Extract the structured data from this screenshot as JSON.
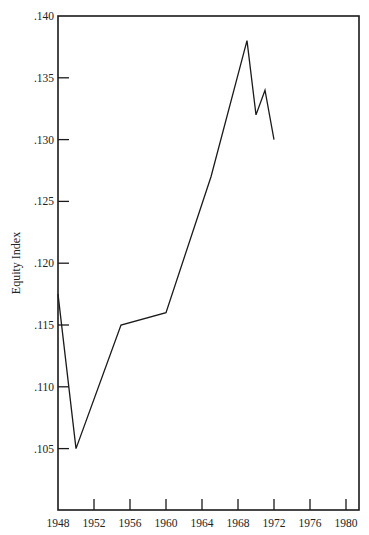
{
  "chart_data": {
    "type": "line",
    "title": "",
    "xlabel": "",
    "ylabel": "Equity Index",
    "xlim": [
      1948,
      1981.5
    ],
    "ylim": [
      0.1,
      0.14
    ],
    "grid": false,
    "legend": null,
    "x_ticks": [
      1948,
      1952,
      1956,
      1960,
      1964,
      1968,
      1972,
      1976,
      1980
    ],
    "x_tick_labels": [
      "1948",
      "1952",
      "1956",
      "1960",
      "1964",
      "1968",
      "1972",
      "1976",
      "1980"
    ],
    "y_ticks": [
      0.105,
      0.11,
      0.115,
      0.12,
      0.125,
      0.13,
      0.135,
      0.14
    ],
    "y_tick_labels": [
      ".105",
      ".110",
      ".115",
      ".120",
      ".125",
      ".130",
      ".135",
      ".140"
    ],
    "series": [
      {
        "name": "Equity Index",
        "x": [
          1948,
          1950,
          1955,
          1960,
          1965,
          1969,
          1970,
          1971,
          1972
        ],
        "values": [
          0.1175,
          0.105,
          0.115,
          0.116,
          0.127,
          0.138,
          0.132,
          0.134,
          0.13
        ]
      }
    ]
  }
}
